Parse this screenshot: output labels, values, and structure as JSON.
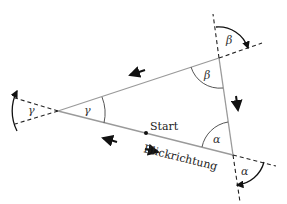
{
  "diagram": {
    "type": "triangle-exterior-angles",
    "vertices": {
      "alpha": {
        "x": 233,
        "y": 155
      },
      "beta": {
        "x": 219,
        "y": 58
      },
      "gamma": {
        "x": 58,
        "y": 111
      }
    },
    "labels": {
      "start": "Start",
      "direction": "Blickrichtung",
      "alpha": "α",
      "beta": "β",
      "gamma": "γ"
    },
    "colors": {
      "side": "#999999",
      "dashed": "#222222",
      "arrow": "#111111",
      "text": "#222222"
    }
  }
}
